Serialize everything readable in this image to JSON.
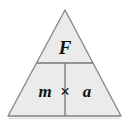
{
  "figure": {
    "name": "formula-triangle",
    "kind": "physics-formula-triangle",
    "equation": "F = m x a",
    "background_color": "#ffffff",
    "fill_color": "#ebebeb",
    "stroke_color": "#8a8a8a",
    "base_stroke_color": "#9a9a9a",
    "divider_color": "#777777",
    "text_color": "#111111",
    "geometry": {
      "apex": "65,10",
      "left_corner": "8,116",
      "right_corner": "121,116",
      "divider_y": "63",
      "divider_left_x": "37",
      "divider_right_x": "93",
      "vertical_divider_x": "65"
    },
    "top_cell": {
      "label": "F",
      "meaning": "force"
    },
    "bottom_left_cell": {
      "label": "m",
      "meaning": "mass"
    },
    "bottom_right_cell": {
      "label": "a",
      "meaning": "acceleration"
    },
    "operator": {
      "label": "×",
      "meaning": "multiply"
    }
  }
}
